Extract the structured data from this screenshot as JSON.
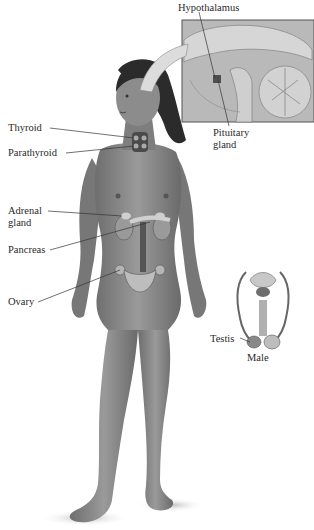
{
  "figure": {
    "labels": {
      "hypothalamus": "Hypothalamus",
      "pituitary_line1": "Pituitary",
      "pituitary_line2": "gland",
      "thyroid": "Thyroid",
      "parathyroid": "Parathyroid",
      "adrenal_line1": "Adrenal",
      "adrenal_line2": "gland",
      "pancreas": "Pancreas",
      "ovary": "Ovary",
      "testis": "Testis",
      "male": "Male"
    },
    "insets": [
      {
        "name": "brain-sagittal-inset",
        "shows": [
          "Hypothalamus",
          "Pituitary gland"
        ]
      },
      {
        "name": "male-reproductive-inset",
        "shows": [
          "Testis"
        ],
        "caption": "Male"
      }
    ],
    "colors": {
      "skin": "#8a8a8a",
      "skin_dark": "#5e5e5e",
      "hair": "#2b2b2b",
      "organ_light": "#c9c9c9",
      "organ_dark": "#6a6a6a",
      "leader_line": "#333333",
      "inset_border": "#555555"
    }
  }
}
